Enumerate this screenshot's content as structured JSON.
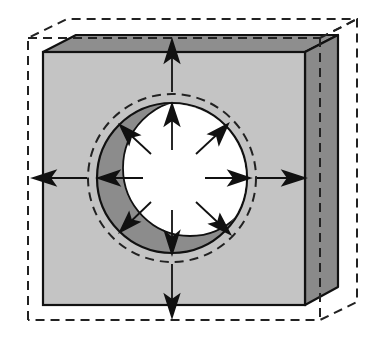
{
  "diagram": {
    "colors": {
      "background": "#ffffff",
      "front_face": "#c4c4c4",
      "top_face": "#8e8e8e",
      "side_face": "#8a8a8a",
      "hole_shadow": "#8c8c8c",
      "hole_opening": "#ffffff",
      "outline": "#111111",
      "dashed": "#222222"
    },
    "labels": []
  }
}
